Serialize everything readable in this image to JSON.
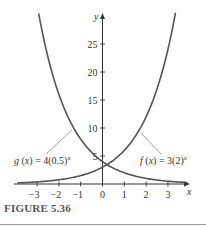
{
  "chart_data": {
    "type": "line",
    "title": "",
    "xlabel": "x",
    "ylabel": "y",
    "xlim": [
      -3.8,
      3.8
    ],
    "ylim": [
      0,
      30.5
    ],
    "x_ticks": [
      -3,
      -2,
      -1,
      0,
      1,
      2,
      3
    ],
    "x_tick_labels": [
      "−3",
      "−2",
      "−1",
      "0",
      "1",
      "2",
      "3"
    ],
    "y_ticks": [
      5,
      10,
      15,
      20,
      25
    ],
    "y_tick_labels": [
      "5",
      "10",
      "15",
      "20",
      "25"
    ],
    "grid": false,
    "legend": "none (inline callout labels)",
    "series": [
      {
        "name": "f(x) = 3(2)^x",
        "label": "f (x) = 3(2)",
        "label_sup": "x",
        "formula": "3*2^x",
        "x": [
          -3.8,
          -3,
          -2,
          -1,
          0,
          1,
          2,
          3,
          3.35
        ],
        "values": [
          0.22,
          0.375,
          0.75,
          1.5,
          3,
          6,
          12,
          24,
          30.5
        ],
        "color": "#555555"
      },
      {
        "name": "g(x) = 4(0.5)^x",
        "label": "g (x) = 4(0.5)",
        "label_sup": "x",
        "formula": "4*0.5^x",
        "x": [
          -2.93,
          -2,
          -1,
          0,
          1,
          2,
          3,
          3.8
        ],
        "values": [
          30.5,
          16,
          8,
          4,
          2,
          1,
          0.5,
          0.29
        ],
        "color": "#555555"
      }
    ]
  },
  "caption": "FIGURE 5.36"
}
